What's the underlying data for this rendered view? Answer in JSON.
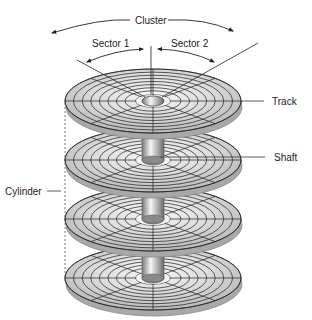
{
  "diagram": {
    "labels": {
      "cluster": "Cluster",
      "sector1": "Sector 1",
      "sector2": "Sector 2",
      "track": "Track",
      "shaft": "Shaft",
      "cylinder": "Cylinder"
    },
    "platters": [
      {
        "cy": 101
      },
      {
        "cy": 160
      },
      {
        "cy": 219
      },
      {
        "cy": 278
      }
    ],
    "geometry": {
      "cx": 153,
      "rx": 88,
      "ry": 32,
      "thickness": 6,
      "rings": 8,
      "hole_rx": 11,
      "hole_ry": 5
    },
    "colors": {
      "platter_light": "#f2f2f2",
      "platter_mid": "#d6d6d6",
      "platter_dark": "#a8a8a8",
      "edge": "#8a8a8a",
      "line": "#222222",
      "shaft_light": "#f4f4f4",
      "shaft_dark": "#8c8c8c"
    }
  }
}
